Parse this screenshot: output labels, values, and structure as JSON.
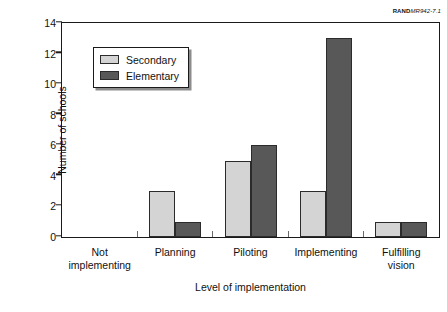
{
  "source_id": {
    "brand": "RAND",
    "number": "MR942-7.1"
  },
  "colors": {
    "secondary": "#d4d4d4",
    "elementary": "#585858",
    "bar_outline": "#2b2b2b",
    "axis": "#1a1a1a",
    "background": "#ffffff",
    "legend_shadow": "#8c8c8c"
  },
  "chart_data": {
    "type": "bar",
    "title": "",
    "xlabel": "Level of implementation",
    "ylabel": "Number of schools",
    "categories": [
      "Not\nimplementing",
      "Planning",
      "Piloting",
      "Implementing",
      "Fulfilling\nvision"
    ],
    "series": [
      {
        "name": "Secondary",
        "color": "#d4d4d4",
        "values": [
          0,
          3,
          5,
          3,
          1
        ]
      },
      {
        "name": "Elementary",
        "color": "#585858",
        "values": [
          0,
          1,
          6,
          13,
          1
        ]
      }
    ],
    "ylim": [
      0,
      14
    ],
    "yticks": [
      0,
      2,
      4,
      6,
      8,
      10,
      12,
      14
    ],
    "ytick_labels": [
      "0",
      "2",
      "4",
      "6",
      "8",
      "10",
      "12",
      "14"
    ],
    "grid": false,
    "legend_position": "upper left inside plot",
    "legend_entries": [
      "Secondary",
      "Elementary"
    ]
  }
}
